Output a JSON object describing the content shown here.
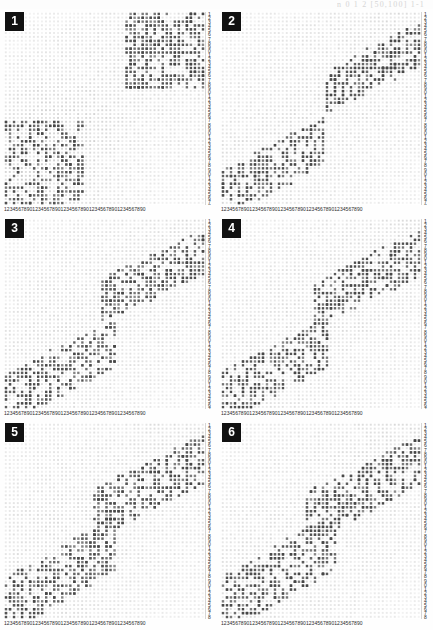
{
  "header": {
    "formula_fragment": "n  0   1   2      [50,100] 1-1"
  },
  "axes": {
    "x_tick_labels": "12345678901234567890123456789012345678901234567890",
    "y_tick_labels": "12345678901234567890123456789012345678901234567890",
    "tick_digit_cycle": "1234567890",
    "cycles": 5
  },
  "colors": {
    "page_background": "#fdfdfd",
    "plot_background": "#ffffff",
    "point": "#555555",
    "point_faint": "#d8d8d8",
    "badge_background": "#111111",
    "badge_text": "#ffffff",
    "tick_text": "#2b2b2b",
    "formula_text": "#c9c9c9"
  },
  "panels": [
    {
      "id": "panel-1",
      "label": "1",
      "seed": 11,
      "chart_ref": 0
    },
    {
      "id": "panel-2",
      "label": "2",
      "seed": 22,
      "chart_ref": 1
    },
    {
      "id": "panel-3",
      "label": "3",
      "seed": 33,
      "chart_ref": 2
    },
    {
      "id": "panel-4",
      "label": "4",
      "seed": 44,
      "chart_ref": 3
    },
    {
      "id": "panel-5",
      "label": "5",
      "seed": 55,
      "chart_ref": 4
    },
    {
      "id": "panel-6",
      "label": "6",
      "seed": 66,
      "chart_ref": 5
    }
  ],
  "chart_data": [
    {
      "type": "scatter",
      "title": "1",
      "xlabel": "",
      "ylabel": "",
      "xlim": [
        0,
        50
      ],
      "ylim": [
        0,
        50
      ],
      "grid": true,
      "legend": null,
      "description": "Two dense rectangular dot-matrix blocks: an upper-right block and a lower-left block, over a faint full-field dot lattice background.",
      "clusters": [
        {
          "name": "upper-right-block",
          "x_range": [
            30,
            50
          ],
          "y_range": [
            30,
            50
          ],
          "n_points": 420,
          "density": 0.62,
          "marker": "square",
          "color": "#555555"
        },
        {
          "name": "lower-left-block",
          "x_range": [
            0,
            20
          ],
          "y_range": [
            0,
            22
          ],
          "n_points": 330,
          "density": 0.48,
          "marker": "square",
          "color": "#555555"
        },
        {
          "name": "background-lattice",
          "x_range": [
            0,
            50
          ],
          "y_range": [
            0,
            50
          ],
          "n_points": 2500,
          "density": 1.0,
          "marker": "square",
          "color": "#e2e2e2"
        }
      ]
    },
    {
      "type": "scatter",
      "title": "2",
      "xlabel": "",
      "ylabel": "",
      "xlim": [
        0,
        50
      ],
      "ylim": [
        0,
        50
      ],
      "grid": true,
      "legend": null,
      "description": "Upper-right diffuse cloud and lower-left diffuse cloud separated by a sparse diagonal band.",
      "clusters": [
        {
          "name": "upper-right-cloud",
          "x_range": [
            26,
            50
          ],
          "y_range": [
            27,
            50
          ],
          "n_points": 300,
          "density": 0.4,
          "marker": "square",
          "color": "#555555"
        },
        {
          "name": "lower-left-cloud",
          "x_range": [
            0,
            26
          ],
          "y_range": [
            0,
            26
          ],
          "n_points": 290,
          "density": 0.38,
          "marker": "square",
          "color": "#555555"
        },
        {
          "name": "background-lattice",
          "x_range": [
            0,
            50
          ],
          "y_range": [
            0,
            50
          ],
          "n_points": 2500,
          "density": 1.0,
          "marker": "square",
          "color": "#e8e8e8"
        }
      ]
    },
    {
      "type": "scatter",
      "title": "3",
      "xlabel": "",
      "ylabel": "",
      "xlim": [
        0,
        50
      ],
      "ylim": [
        0,
        50
      ],
      "grid": true,
      "legend": null,
      "description": "Upper-right cloud extending left along the top and a broad lower-left cloud.",
      "clusters": [
        {
          "name": "upper-right-cloud",
          "x_range": [
            24,
            50
          ],
          "y_range": [
            26,
            50
          ],
          "n_points": 310,
          "density": 0.42,
          "marker": "square",
          "color": "#555555"
        },
        {
          "name": "lower-left-cloud",
          "x_range": [
            0,
            28
          ],
          "y_range": [
            0,
            27
          ],
          "n_points": 320,
          "density": 0.42,
          "marker": "square",
          "color": "#555555"
        },
        {
          "name": "background-lattice",
          "x_range": [
            0,
            50
          ],
          "y_range": [
            0,
            50
          ],
          "n_points": 2500,
          "density": 1.0,
          "marker": "square",
          "color": "#e8e8e8"
        }
      ]
    },
    {
      "type": "scatter",
      "title": "4",
      "xlabel": "",
      "ylabel": "",
      "xlim": [
        0,
        50
      ],
      "ylim": [
        0,
        50
      ],
      "grid": true,
      "legend": null,
      "description": "Similar two-cluster diagonal structure with slightly more overlap near the centre.",
      "clusters": [
        {
          "name": "upper-right-cloud",
          "x_range": [
            23,
            50
          ],
          "y_range": [
            25,
            50
          ],
          "n_points": 300,
          "density": 0.41,
          "marker": "square",
          "color": "#555555"
        },
        {
          "name": "lower-left-cloud",
          "x_range": [
            0,
            27
          ],
          "y_range": [
            0,
            28
          ],
          "n_points": 310,
          "density": 0.41,
          "marker": "square",
          "color": "#555555"
        },
        {
          "name": "background-lattice",
          "x_range": [
            0,
            50
          ],
          "y_range": [
            0,
            50
          ],
          "n_points": 2500,
          "density": 1.0,
          "marker": "square",
          "color": "#e8e8e8"
        }
      ]
    },
    {
      "type": "scatter",
      "title": "5",
      "xlabel": "",
      "ylabel": "",
      "xlim": [
        0,
        50
      ],
      "ylim": [
        0,
        50
      ],
      "grid": true,
      "legend": null,
      "description": "Two elongated clouds forming a broad ascending diagonal with a sparse bridge.",
      "clusters": [
        {
          "name": "upper-right-cloud",
          "x_range": [
            22,
            50
          ],
          "y_range": [
            24,
            50
          ],
          "n_points": 320,
          "density": 0.43,
          "marker": "square",
          "color": "#555555"
        },
        {
          "name": "lower-left-cloud",
          "x_range": [
            0,
            28
          ],
          "y_range": [
            0,
            30
          ],
          "n_points": 330,
          "density": 0.43,
          "marker": "square",
          "color": "#555555"
        },
        {
          "name": "background-lattice",
          "x_range": [
            0,
            50
          ],
          "y_range": [
            0,
            50
          ],
          "n_points": 2500,
          "density": 1.0,
          "marker": "square",
          "color": "#e8e8e8"
        }
      ]
    },
    {
      "type": "scatter",
      "title": "6",
      "xlabel": "",
      "ylabel": "",
      "xlim": [
        0,
        50
      ],
      "ylim": [
        0,
        50
      ],
      "grid": true,
      "legend": null,
      "description": "Two clouds with the strongest diagonal separation; densest of the six panels.",
      "clusters": [
        {
          "name": "upper-right-cloud",
          "x_range": [
            21,
            50
          ],
          "y_range": [
            23,
            50
          ],
          "n_points": 340,
          "density": 0.45,
          "marker": "square",
          "color": "#555555"
        },
        {
          "name": "lower-left-cloud",
          "x_range": [
            0,
            29
          ],
          "y_range": [
            0,
            31
          ],
          "n_points": 340,
          "density": 0.45,
          "marker": "square",
          "color": "#555555"
        },
        {
          "name": "background-lattice",
          "x_range": [
            0,
            50
          ],
          "y_range": [
            0,
            50
          ],
          "n_points": 2500,
          "density": 1.0,
          "marker": "square",
          "color": "#e8e8e8"
        }
      ]
    }
  ]
}
